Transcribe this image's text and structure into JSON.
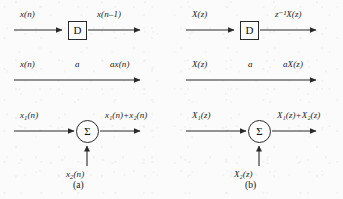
{
  "figure": {
    "background_color": "#fbfbfb",
    "ink_color": "#2a2a2a",
    "panels": [
      {
        "id": "a",
        "caption": "(a)",
        "domain_name": "time-domain",
        "rows": [
          {
            "type": "unit-delay",
            "input_label": "x(n)",
            "block_label": "D",
            "output_label": "x(n–1)"
          },
          {
            "type": "multiplier",
            "input_label": "x(n)",
            "gain_label": "a",
            "output_label": "ax(n)"
          },
          {
            "type": "adder",
            "input_label": "x₁(n)",
            "second_input_label": "x₂(n)",
            "block_label": "Σ",
            "output_label": "x₁(n)+x₂(n)"
          }
        ]
      },
      {
        "id": "b",
        "caption": "(b)",
        "domain_name": "z-domain",
        "rows": [
          {
            "type": "unit-delay",
            "input_label": "X(z)",
            "block_label": "D",
            "output_label": "z⁻¹X(z)"
          },
          {
            "type": "multiplier",
            "input_label": "X(z)",
            "gain_label": "a",
            "output_label": "aX(z)"
          },
          {
            "type": "adder",
            "input_label": "X₁(z)",
            "second_input_label": "X₂(z)",
            "block_label": "Σ",
            "output_label": "X₁(z)+X₂(z)"
          }
        ]
      }
    ]
  },
  "labels": {
    "a_delay_in": "x(n)",
    "a_delay_block": "D",
    "a_delay_out_base": "x(n",
    "a_delay_out_tail": "1)",
    "a_mul_in": "x(n)",
    "a_mul_gain": "a",
    "a_mul_out": "ax(n)",
    "a_add_in1_base": "x",
    "a_add_in1_sub": "1",
    "a_add_in1_tail": "(n)",
    "a_add_in2_base": "x",
    "a_add_in2_sub": "2",
    "a_add_in2_tail": "(n)",
    "a_add_block": "Σ",
    "a_add_out": "x₁(n)+x₂(n)",
    "a_caption": "(a)",
    "b_delay_in": "X(z)",
    "b_delay_block": "D",
    "b_delay_out": "z⁻¹X(z)",
    "b_mul_in": "X(z)",
    "b_mul_gain": "a",
    "b_mul_out": "aX(z)",
    "b_add_in1": "X₁(z)",
    "b_add_in2": "X₂(z)",
    "b_add_block": "Σ",
    "b_add_out": "X₁(z)+X₂(z)",
    "b_caption": "(b)"
  }
}
